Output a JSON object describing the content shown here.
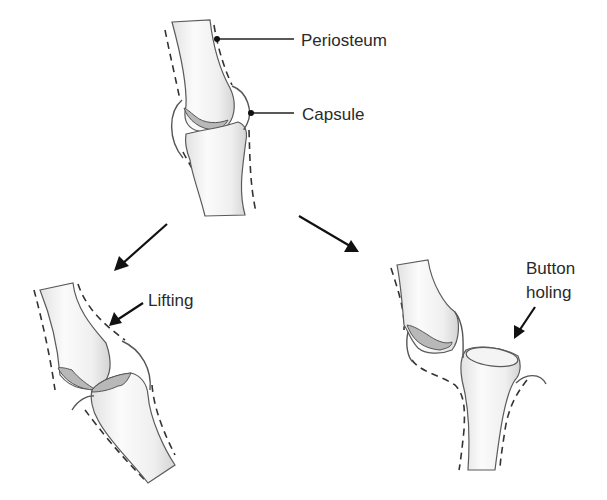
{
  "diagram": {
    "labels": {
      "periosteum": "Periosteum",
      "capsule": "Capsule",
      "lifting": "Lifting",
      "button_line1": "Button",
      "button_line2": "holing"
    },
    "panels": [
      {
        "id": "normal",
        "caption": "Normal joint with periosteum and capsule"
      },
      {
        "id": "lifting",
        "caption": "Lifting"
      },
      {
        "id": "button-holing",
        "caption": "Button holing"
      }
    ],
    "colors": {
      "background": "#ffffff",
      "line": "#222222",
      "bone_fill": "#f2f2f2",
      "cartilage": "#b8b8b8"
    }
  }
}
